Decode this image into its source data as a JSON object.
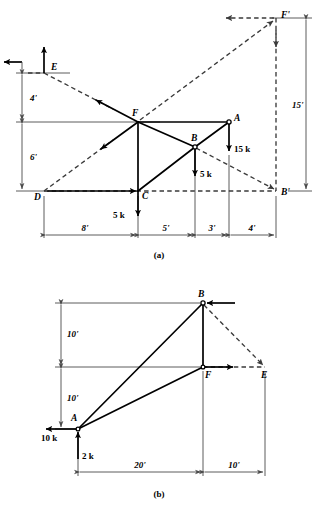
{
  "figure": {
    "panels": [
      {
        "id": "a",
        "caption": "(a)",
        "joints": [
          {
            "name": "E",
            "label": "E",
            "x": 44,
            "y": 73
          },
          {
            "name": "F",
            "label": "F",
            "x": 138,
            "y": 122
          },
          {
            "name": "A",
            "label": "A",
            "x": 229,
            "y": 122
          },
          {
            "name": "B",
            "label": "B",
            "x": 195,
            "y": 147
          },
          {
            "name": "C",
            "label": "C",
            "x": 138,
            "y": 191
          },
          {
            "name": "D",
            "label": "D",
            "x": 44,
            "y": 191
          },
          {
            "name": "Fp",
            "label": "F'",
            "x": 276,
            "y": 18
          },
          {
            "name": "Bp",
            "label": "B'",
            "x": 276,
            "y": 191
          }
        ],
        "loads": [
          {
            "label": "15 k",
            "at": "A",
            "direction": "down"
          },
          {
            "label": "5 k",
            "at": "B",
            "direction": "down"
          },
          {
            "label": "5 k",
            "at": "C",
            "direction": "down"
          }
        ],
        "dimensions": {
          "horizontal": [
            "8'",
            "5'",
            "3'",
            "4'"
          ],
          "vertical_left": [
            "4'",
            "6'"
          ],
          "vertical_right": [
            "15'"
          ]
        }
      },
      {
        "id": "b",
        "caption": "(b)",
        "joints": [
          {
            "name": "B",
            "label": "B",
            "x": 203,
            "y": 303
          },
          {
            "name": "F",
            "label": "F",
            "x": 203,
            "y": 367
          },
          {
            "name": "E",
            "label": "E",
            "x": 265,
            "y": 367
          },
          {
            "name": "A",
            "label": "A",
            "x": 78,
            "y": 429
          }
        ],
        "loads": [
          {
            "label": "10 k",
            "at": "A",
            "direction": "left"
          },
          {
            "label": "2 k",
            "at": "A",
            "direction": "up"
          }
        ],
        "dimensions": {
          "horizontal": [
            "20'",
            "10'"
          ],
          "vertical_left": [
            "10'",
            "10'"
          ]
        }
      }
    ],
    "colors": {
      "member_solid": "#000000",
      "member_dashed": "#3a3a3a",
      "dimension": "#4a4a4a",
      "background": "#ffffff"
    }
  }
}
